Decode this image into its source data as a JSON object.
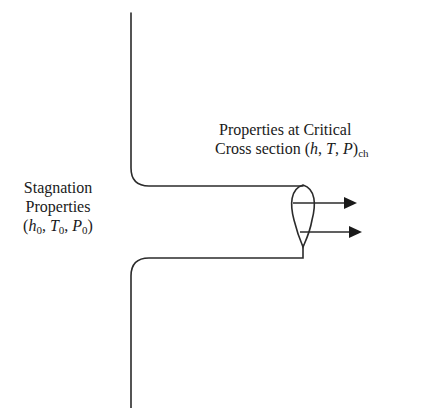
{
  "diagram": {
    "colors": {
      "stroke": "#2b2b2b",
      "text": "#1a1a1a",
      "background": "#ffffff"
    },
    "left_label": {
      "line1": "Stagnation",
      "line2": "Properties",
      "line3": {
        "open": "(",
        "h": "h",
        "h_sub": "0",
        "sep1": ", ",
        "T": "T",
        "T_sub": "0",
        "sep2": ", ",
        "P": "P",
        "P_sub": "0",
        "close": ")"
      }
    },
    "right_label": {
      "line1": "Properties at Critical",
      "line2": {
        "prefix": "Cross section (",
        "h": "h",
        "sep1": ", ",
        "T": "T",
        "sep2": ", ",
        "P": "P",
        "close": ")",
        "sub": "ch"
      }
    },
    "arrows": [
      {
        "name": "upper-flow-arrow",
        "y": 203
      },
      {
        "name": "lower-flow-arrow",
        "y": 232
      }
    ]
  }
}
